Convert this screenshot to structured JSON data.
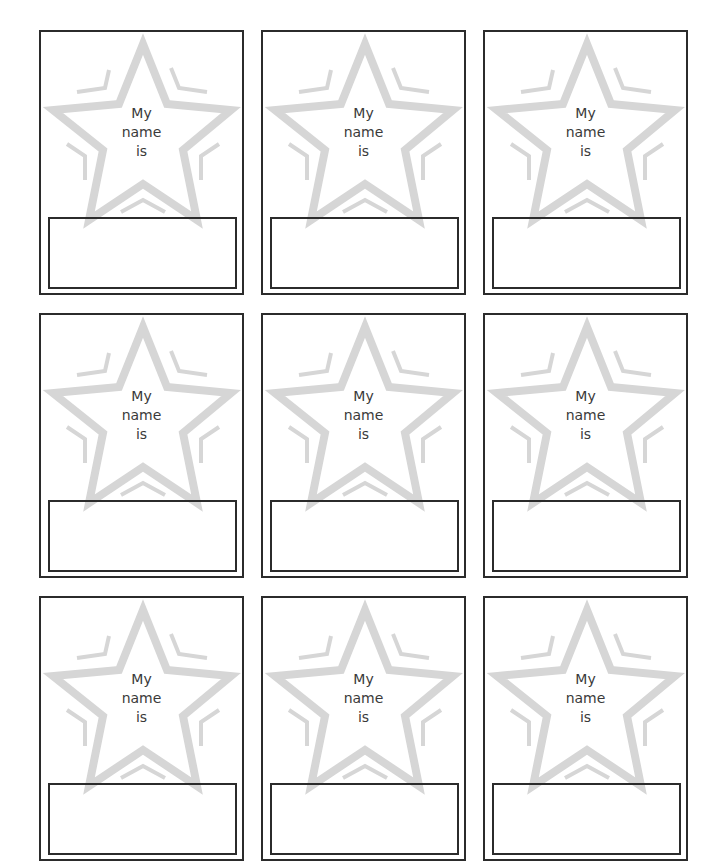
{
  "sheet": {
    "title": "My name is star name tags",
    "colors": {
      "border": "#2b2b2b",
      "star_stroke": "#d6d6d6",
      "text": "#3a3a3a",
      "background": "#ffffff"
    },
    "cards": [
      {
        "line1": "My",
        "line2": "name",
        "line3": "is",
        "name_value": ""
      },
      {
        "line1": "My",
        "line2": "name",
        "line3": "is",
        "name_value": ""
      },
      {
        "line1": "My",
        "line2": "name",
        "line3": "is",
        "name_value": ""
      },
      {
        "line1": "My",
        "line2": "name",
        "line3": "is",
        "name_value": ""
      },
      {
        "line1": "My",
        "line2": "name",
        "line3": "is",
        "name_value": ""
      },
      {
        "line1": "My",
        "line2": "name",
        "line3": "is",
        "name_value": ""
      },
      {
        "line1": "My",
        "line2": "name",
        "line3": "is",
        "name_value": ""
      },
      {
        "line1": "My",
        "line2": "name",
        "line3": "is",
        "name_value": ""
      },
      {
        "line1": "My",
        "line2": "name",
        "line3": "is",
        "name_value": ""
      }
    ],
    "icons": {
      "star": "star-outline-icon"
    }
  }
}
